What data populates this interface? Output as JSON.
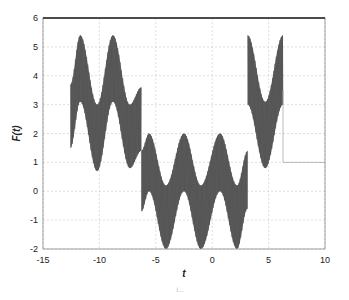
{
  "chart_data": {
    "type": "line",
    "title": "",
    "xlabel": "t",
    "ylabel": "F(t)",
    "xlim": [
      -15,
      10
    ],
    "ylim": [
      -2,
      6
    ],
    "grid": true,
    "legend": null,
    "x_ticks": [
      -15,
      -10,
      -5,
      0,
      5,
      10
    ],
    "y_ticks": [
      -2,
      -1,
      0,
      1,
      2,
      3,
      4,
      5,
      6
    ],
    "x_tick_labels": [
      "-15",
      "-10",
      "-5",
      "0",
      "5",
      "10"
    ],
    "y_tick_labels": [
      "-2",
      "-1",
      "0",
      "1",
      "2",
      "3",
      "4",
      "5",
      "6"
    ],
    "segments": [
      {
        "t_range": [
          -12.57,
          -6.28
        ],
        "upper": {
          "t": [
            -12.57,
            -11.7,
            -10.2,
            -8.8,
            -7.3,
            -6.28
          ],
          "y": [
            3.7,
            5.4,
            3.0,
            5.4,
            3.0,
            3.6
          ]
        },
        "lower": {
          "t": [
            -12.57,
            -11.7,
            -10.2,
            -8.8,
            -7.3,
            -6.28
          ],
          "y": [
            1.5,
            3.1,
            0.7,
            3.1,
            0.8,
            1.4
          ]
        }
      },
      {
        "t_range": [
          -6.28,
          3.14
        ],
        "upper": {
          "t": [
            -6.28,
            -5.6,
            -4.1,
            -2.5,
            -1.0,
            0.7,
            2.2,
            3.14
          ],
          "y": [
            1.4,
            2.0,
            0.2,
            2.0,
            0.2,
            2.0,
            0.2,
            1.4
          ]
        },
        "lower": {
          "t": [
            -6.28,
            -5.6,
            -4.1,
            -2.5,
            -1.0,
            0.7,
            2.2,
            3.14
          ],
          "y": [
            -0.7,
            0.0,
            -2.0,
            0.0,
            -2.0,
            0.0,
            -2.0,
            -0.6
          ]
        }
      },
      {
        "t_range": [
          3.14,
          6.28
        ],
        "upper": {
          "t": [
            3.14,
            4.7,
            6.28
          ],
          "y": [
            5.4,
            3.1,
            5.4
          ]
        },
        "lower": {
          "t": [
            3.14,
            4.7,
            6.28
          ],
          "y": [
            3.0,
            0.8,
            3.0
          ]
        }
      }
    ],
    "tail_line": {
      "t": [
        6.28,
        6.28,
        10
      ],
      "y": [
        3.5,
        1.0,
        1.0
      ]
    },
    "fill_color": "#4a4a4a",
    "grid_color": "#d0d0d0"
  },
  "caption": "f..."
}
